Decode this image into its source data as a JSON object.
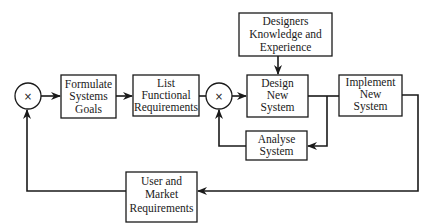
{
  "diagram": {
    "type": "design process feedback loop",
    "nodes": {
      "sum1": {
        "symbol": "×"
      },
      "formulate": {
        "lines": [
          "Formulate",
          "Systems",
          "Goals"
        ]
      },
      "list": {
        "lines": [
          "List",
          "Functional",
          "Requirements"
        ]
      },
      "sum2": {
        "symbol": "×"
      },
      "designers": {
        "lines": [
          "Designers",
          "Knowledge and",
          "Experience"
        ]
      },
      "design": {
        "lines": [
          "Design",
          "New",
          "System"
        ]
      },
      "implement": {
        "lines": [
          "Implement",
          "New",
          "System"
        ]
      },
      "analyse": {
        "lines": [
          "Analyse",
          "System"
        ]
      },
      "user": {
        "lines": [
          "User and",
          "Market",
          "Requirements"
        ]
      }
    },
    "edges": [
      {
        "from": "sum1",
        "to": "formulate"
      },
      {
        "from": "formulate",
        "to": "list"
      },
      {
        "from": "list",
        "to": "sum2"
      },
      {
        "from": "sum2",
        "to": "design"
      },
      {
        "from": "designers",
        "to": "design"
      },
      {
        "from": "design",
        "to": "implement"
      },
      {
        "from": "design",
        "to": "analyse"
      },
      {
        "from": "analyse",
        "to": "sum2"
      },
      {
        "from": "implement",
        "to": "user"
      },
      {
        "from": "user",
        "to": "sum1"
      }
    ],
    "colors": {
      "stroke": "#1a1a1a",
      "background": "#ffffff"
    }
  }
}
